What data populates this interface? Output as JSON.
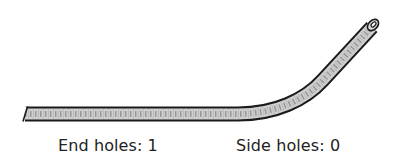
{
  "diagram": {
    "colors": {
      "tube_fill": "#cfcfcf",
      "tube_outline": "#1a1a1a",
      "texture": "#8a8a8a",
      "text": "#222222",
      "background": "#ffffff"
    }
  },
  "labels": {
    "end_holes": "End holes: 1",
    "side_holes": "Side holes: 0"
  }
}
